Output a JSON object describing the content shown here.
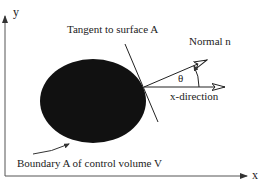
{
  "diagram": {
    "axes": {
      "x_label": "x",
      "y_label": "y"
    },
    "labels": {
      "tangent": "Tangent to surface A",
      "normal": "Normal  n",
      "theta": "θ",
      "x_direction": "x-direction",
      "boundary": "Boundary  A  of control volume  V"
    },
    "colors": {
      "ink": "#222222",
      "body_fill": "#111111",
      "background": "#ffffff"
    }
  }
}
